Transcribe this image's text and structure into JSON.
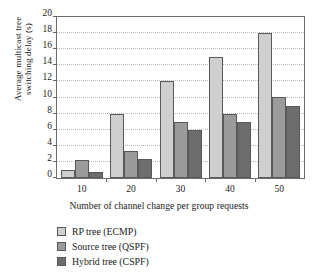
{
  "chart_data": {
    "type": "bar",
    "title": "",
    "xlabel": "Number of channel change per group requests",
    "ylabel_line1": "Average multicast tree",
    "ylabel_line2": "switching delay (s)",
    "categories": [
      "10",
      "20",
      "30",
      "40",
      "50"
    ],
    "series": [
      {
        "name": "RP tree (ECMP)",
        "color": "#cfcfcf",
        "values": [
          1.0,
          8.0,
          12.1,
          15.0,
          18.0
        ]
      },
      {
        "name": "Source tree (QSPF)",
        "color": "#9b9b9b",
        "values": [
          2.2,
          3.4,
          7.0,
          8.0,
          10.1
        ]
      },
      {
        "name": "Hybrid tree (CSPF)",
        "color": "#6d6d6d",
        "values": [
          0.7,
          2.4,
          6.0,
          7.0,
          9.0
        ]
      }
    ],
    "ylim": [
      0,
      20
    ],
    "ytick_step": 2,
    "yticks": [
      "0",
      "2",
      "4",
      "6",
      "8",
      "10",
      "12",
      "14",
      "16",
      "18",
      "20"
    ],
    "grid": "horizontal-dotted",
    "legend_position": "below-left"
  },
  "legend": {
    "items": [
      {
        "label": "RP tree (ECMP)"
      },
      {
        "label": "Source tree (QSPF)"
      },
      {
        "label": "Hybrid tree (CSPF)"
      }
    ]
  }
}
